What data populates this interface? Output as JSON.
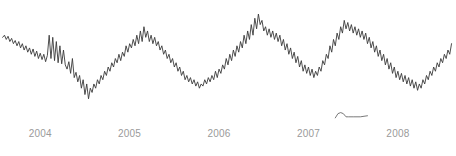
{
  "chart_data": {
    "type": "line",
    "title": "",
    "subtitle": "",
    "xlabel": "",
    "ylabel": "",
    "grid": false,
    "legend": "none",
    "line_color": "#3a3a3a",
    "line_width": 0.9,
    "background": "#ffffff",
    "axis_label_color": "#9a9a9a",
    "xlim": [
      2003.55,
      2008.65
    ],
    "ylim": [
      0,
      100
    ],
    "x_tick_labels": [
      "2004",
      "2005",
      "2006",
      "2007",
      "2008"
    ],
    "x_tick_values": [
      2004,
      2005,
      2006,
      2007,
      2008
    ],
    "y_tick_labels": [],
    "series": [
      {
        "name": "main-series",
        "color": "#3a3a3a",
        "x": [
          2003.58,
          2003.6,
          2003.62,
          2003.64,
          2003.66,
          2003.68,
          2003.7,
          2003.72,
          2003.74,
          2003.76,
          2003.78,
          2003.8,
          2003.82,
          2003.84,
          2003.86,
          2003.88,
          2003.9,
          2003.92,
          2003.94,
          2003.96,
          2003.98,
          2004.0,
          2004.02,
          2004.04,
          2004.06,
          2004.08,
          2004.1,
          2004.12,
          2004.14,
          2004.16,
          2004.18,
          2004.2,
          2004.22,
          2004.24,
          2004.26,
          2004.28,
          2004.3,
          2004.32,
          2004.34,
          2004.36,
          2004.38,
          2004.4,
          2004.42,
          2004.44,
          2004.46,
          2004.48,
          2004.5,
          2004.52,
          2004.54,
          2004.56,
          2004.58,
          2004.6,
          2004.62,
          2004.64,
          2004.66,
          2004.68,
          2004.7,
          2004.72,
          2004.74,
          2004.76,
          2004.78,
          2004.8,
          2004.82,
          2004.84,
          2004.86,
          2004.88,
          2004.9,
          2004.92,
          2004.94,
          2004.96,
          2004.98,
          2005.0,
          2005.02,
          2005.04,
          2005.06,
          2005.08,
          2005.1,
          2005.12,
          2005.14,
          2005.16,
          2005.18,
          2005.2,
          2005.22,
          2005.24,
          2005.26,
          2005.28,
          2005.3,
          2005.32,
          2005.34,
          2005.36,
          2005.38,
          2005.4,
          2005.42,
          2005.44,
          2005.46,
          2005.48,
          2005.5,
          2005.52,
          2005.54,
          2005.56,
          2005.58,
          2005.6,
          2005.62,
          2005.64,
          2005.66,
          2005.68,
          2005.7,
          2005.72,
          2005.74,
          2005.76,
          2005.78,
          2005.8,
          2005.82,
          2005.84,
          2005.86,
          2005.88,
          2005.9,
          2005.92,
          2005.94,
          2005.96,
          2005.98,
          2006.0,
          2006.02,
          2006.04,
          2006.06,
          2006.08,
          2006.1,
          2006.12,
          2006.14,
          2006.16,
          2006.18,
          2006.2,
          2006.22,
          2006.24,
          2006.26,
          2006.28,
          2006.3,
          2006.32,
          2006.34,
          2006.36,
          2006.38,
          2006.4,
          2006.42,
          2006.44,
          2006.46,
          2006.48,
          2006.5,
          2006.52,
          2006.54,
          2006.56,
          2006.58,
          2006.6,
          2006.62,
          2006.64,
          2006.66,
          2006.68,
          2006.7,
          2006.72,
          2006.74,
          2006.76,
          2006.78,
          2006.8,
          2006.82,
          2006.84,
          2006.86,
          2006.88,
          2006.9,
          2006.92,
          2006.94,
          2006.96,
          2006.98,
          2007.0,
          2007.02,
          2007.04,
          2007.06,
          2007.08,
          2007.1,
          2007.12,
          2007.14,
          2007.16,
          2007.18,
          2007.2,
          2007.22,
          2007.24,
          2007.26,
          2007.28,
          2007.3,
          2007.32,
          2007.34,
          2007.36,
          2007.38,
          2007.4,
          2007.42,
          2007.44,
          2007.46,
          2007.48,
          2007.5,
          2007.52,
          2007.54,
          2007.56,
          2007.58,
          2007.6,
          2007.62,
          2007.64,
          2007.66,
          2007.68,
          2007.7,
          2007.72,
          2007.74,
          2007.76,
          2007.78,
          2007.8,
          2007.82,
          2007.84,
          2007.86,
          2007.88,
          2007.9,
          2007.92,
          2007.94,
          2007.96,
          2007.98,
          2008.0,
          2008.02,
          2008.04,
          2008.06,
          2008.08,
          2008.1,
          2008.12,
          2008.14,
          2008.16,
          2008.18,
          2008.2,
          2008.22,
          2008.24,
          2008.26,
          2008.28,
          2008.3,
          2008.32,
          2008.34,
          2008.36,
          2008.38,
          2008.4,
          2008.42,
          2008.44,
          2008.46,
          2008.48,
          2008.5,
          2008.52,
          2008.54,
          2008.56,
          2008.58,
          2008.6
        ],
        "y": [
          78,
          80,
          76,
          79,
          74,
          77,
          72,
          75,
          70,
          74,
          68,
          72,
          66,
          70,
          64,
          68,
          62,
          67,
          60,
          65,
          58,
          63,
          57,
          62,
          55,
          61,
          80,
          58,
          78,
          56,
          74,
          54,
          70,
          53,
          66,
          52,
          48,
          55,
          44,
          58,
          40,
          45,
          36,
          42,
          30,
          38,
          24,
          34,
          20,
          30,
          26,
          34,
          30,
          38,
          34,
          42,
          38,
          46,
          42,
          50,
          46,
          54,
          50,
          58,
          54,
          62,
          56,
          64,
          60,
          70,
          64,
          72,
          68,
          76,
          70,
          80,
          72,
          84,
          74,
          88,
          78,
          84,
          74,
          80,
          72,
          78,
          70,
          74,
          66,
          70,
          62,
          66,
          58,
          62,
          54,
          58,
          50,
          54,
          46,
          50,
          42,
          46,
          38,
          42,
          36,
          40,
          34,
          38,
          32,
          36,
          30,
          34,
          32,
          38,
          34,
          40,
          36,
          42,
          38,
          46,
          40,
          48,
          44,
          52,
          48,
          58,
          52,
          62,
          56,
          66,
          60,
          70,
          64,
          74,
          68,
          80,
          72,
          84,
          76,
          90,
          80,
          96,
          86,
          100,
          90,
          94,
          84,
          88,
          80,
          86,
          78,
          84,
          76,
          82,
          74,
          80,
          70,
          76,
          66,
          72,
          62,
          68,
          58,
          64,
          54,
          60,
          50,
          56,
          46,
          52,
          44,
          50,
          42,
          48,
          40,
          46,
          42,
          50,
          46,
          56,
          52,
          62,
          58,
          70,
          64,
          76,
          70,
          82,
          76,
          88,
          82,
          94,
          86,
          92,
          84,
          90,
          82,
          88,
          80,
          86,
          78,
          84,
          76,
          82,
          72,
          78,
          68,
          74,
          64,
          70,
          60,
          66,
          56,
          62,
          52,
          58,
          48,
          54,
          44,
          50,
          40,
          46,
          38,
          44,
          36,
          42,
          34,
          40,
          32,
          38,
          30,
          36,
          28,
          34,
          30,
          38,
          34,
          42,
          38,
          46,
          42,
          50,
          46,
          54,
          50,
          58,
          54,
          62,
          58,
          66,
          62,
          72
        ]
      },
      {
        "name": "inset-series",
        "color": "#6a6a6a",
        "note": "small flat sparkline fragment near lower middle-right",
        "x": [
          2007.3,
          2007.33,
          2007.36,
          2007.39,
          2007.42,
          2007.45,
          2007.5,
          2007.58,
          2007.66
        ],
        "y": [
          2,
          6,
          7,
          6,
          3,
          3,
          3,
          3,
          4
        ]
      }
    ],
    "annotations": []
  },
  "axis": {
    "tick_label_color": "#9a9a9a"
  }
}
